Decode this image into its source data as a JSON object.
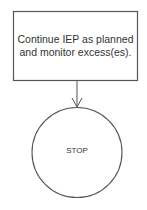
{
  "diagram": {
    "process_box": {
      "text": "Continue IEP as planned and monitor excess(es)."
    },
    "terminal": {
      "text": "STOP"
    },
    "colors": {
      "stroke": "#555555",
      "text": "#333333",
      "background": "#ffffff"
    }
  }
}
